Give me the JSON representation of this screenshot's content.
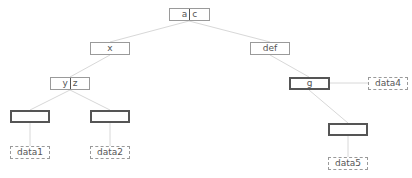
{
  "diagram": {
    "type": "tree",
    "nodes": [
      {
        "id": "root",
        "label_left": "a",
        "label_right": "c",
        "split": true,
        "style": "thin",
        "x": 169,
        "y": 8,
        "w": 41
      },
      {
        "id": "x",
        "label": "x",
        "style": "thin",
        "x": 90,
        "y": 42,
        "w": 40
      },
      {
        "id": "def",
        "label": "def",
        "style": "thin",
        "x": 250,
        "y": 42,
        "w": 40
      },
      {
        "id": "yz",
        "label_left": "y",
        "label_right": "z",
        "split": true,
        "style": "thin",
        "x": 50,
        "y": 77,
        "w": 40
      },
      {
        "id": "g",
        "label": "g",
        "style": "thick",
        "x": 289,
        "y": 77,
        "w": 41
      },
      {
        "id": "data4",
        "label": "data4",
        "style": "dashed",
        "x": 368,
        "y": 77,
        "w": 40
      },
      {
        "id": "empty1",
        "label": "",
        "style": "thick",
        "x": 10,
        "y": 110,
        "w": 40
      },
      {
        "id": "empty2",
        "label": "",
        "style": "thick",
        "x": 90,
        "y": 110,
        "w": 40
      },
      {
        "id": "empty3",
        "label": "",
        "style": "thick",
        "x": 328,
        "y": 123,
        "w": 40
      },
      {
        "id": "data1",
        "label": "data1",
        "style": "dashed",
        "x": 10,
        "y": 146,
        "w": 40
      },
      {
        "id": "data2",
        "label": "data2",
        "style": "dashed",
        "x": 90,
        "y": 146,
        "w": 40
      },
      {
        "id": "data5",
        "label": "data5",
        "style": "dashed",
        "x": 328,
        "y": 157,
        "w": 40
      }
    ],
    "edges": [
      [
        "root",
        "x"
      ],
      [
        "root",
        "def"
      ],
      [
        "x",
        "yz"
      ],
      [
        "def",
        "g"
      ],
      [
        "g",
        "data4"
      ],
      [
        "yz",
        "empty1"
      ],
      [
        "yz",
        "empty2"
      ],
      [
        "g",
        "empty3"
      ],
      [
        "empty1",
        "data1"
      ],
      [
        "empty2",
        "data2"
      ],
      [
        "empty3",
        "data5"
      ]
    ],
    "edge_color": "#d8d8d8"
  }
}
